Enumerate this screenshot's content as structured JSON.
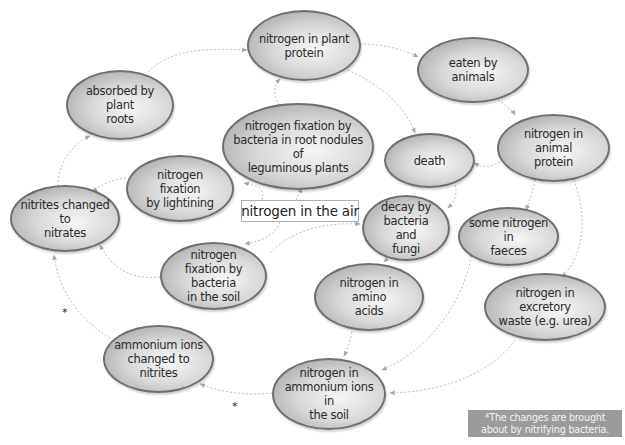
{
  "diagram": {
    "center_label": "nitrogen in the air",
    "nodes": [
      {
        "id": "plant-protein",
        "label": "nitrogen in plant\nprotein"
      },
      {
        "id": "eaten-by-animals",
        "label": "eaten by animals"
      },
      {
        "id": "absorbed-by-roots",
        "label": "absorbed by plant\nroots"
      },
      {
        "id": "root-nodules",
        "label": "nitrogen fixation by\nbacteria in root nodules of\nleguminous plants"
      },
      {
        "id": "animal-protein",
        "label": "nitrogen in animal\nprotein"
      },
      {
        "id": "death",
        "label": "death"
      },
      {
        "id": "lightning",
        "label": "nitrogen fixation\nby lightining"
      },
      {
        "id": "nitrites-to-nitrates",
        "label": "nitrites changed to\nnitrates"
      },
      {
        "id": "decay",
        "label": "decay by\nbacteria and\nfungi"
      },
      {
        "id": "faeces",
        "label": "some nitrogen in\nfaeces"
      },
      {
        "id": "soil-bacteria",
        "label": "nitrogen\nfixation by bacteria\nin the soil"
      },
      {
        "id": "amino-acids",
        "label": "nitrogen in amino\nacids"
      },
      {
        "id": "excretory-waste",
        "label": "nitrogen in excretory\nwaste (e.g. urea)"
      },
      {
        "id": "ammonium-to-nitrites",
        "label": "ammonium ions\nchanged to nitrites"
      },
      {
        "id": "ammonium-soil",
        "label": "nitrogen in\nammonium ions in\nthe soil"
      }
    ],
    "edges": [
      {
        "from": "absorbed-by-roots",
        "to": "plant-protein"
      },
      {
        "from": "plant-protein",
        "to": "eaten-by-animals"
      },
      {
        "from": "eaten-by-animals",
        "to": "animal-protein"
      },
      {
        "from": "plant-protein",
        "to": "death"
      },
      {
        "from": "animal-protein",
        "to": "death"
      },
      {
        "from": "death",
        "to": "decay"
      },
      {
        "from": "animal-protein",
        "to": "faeces"
      },
      {
        "from": "animal-protein",
        "to": "excretory-waste"
      },
      {
        "from": "decay",
        "to": "amino-acids"
      },
      {
        "from": "amino-acids",
        "to": "ammonium-soil"
      },
      {
        "from": "faeces",
        "to": "ammonium-soil"
      },
      {
        "from": "excretory-waste",
        "to": "ammonium-soil"
      },
      {
        "from": "ammonium-soil",
        "to": "ammonium-to-nitrites",
        "marker": "*"
      },
      {
        "from": "ammonium-to-nitrites",
        "to": "nitrites-to-nitrates",
        "marker": "*"
      },
      {
        "from": "nitrites-to-nitrates",
        "to": "absorbed-by-roots"
      },
      {
        "from": "nitrogen-in-the-air",
        "to": "lightning"
      },
      {
        "from": "nitrogen-in-the-air",
        "to": "soil-bacteria"
      },
      {
        "from": "nitrogen-in-the-air",
        "to": "root-nodules"
      },
      {
        "from": "nitrogen-in-the-air",
        "to": "decay"
      },
      {
        "from": "lightning",
        "to": "nitrites-to-nitrates"
      },
      {
        "from": "soil-bacteria",
        "to": "nitrites-to-nitrates"
      },
      {
        "from": "root-nodules",
        "to": "plant-protein"
      }
    ],
    "star_markers": [
      "*",
      "*"
    ],
    "note": "*The changes are brought\nabout by nitrifying bacteria."
  },
  "colors": {
    "node_fill_light": "#f6f6f6",
    "node_fill_dark": "#a9a9a9",
    "node_border": "#6f6f6f",
    "arrow": "#b5b5b5",
    "note_bg": "#9b9b9b",
    "note_text": "#f4f4f4"
  }
}
